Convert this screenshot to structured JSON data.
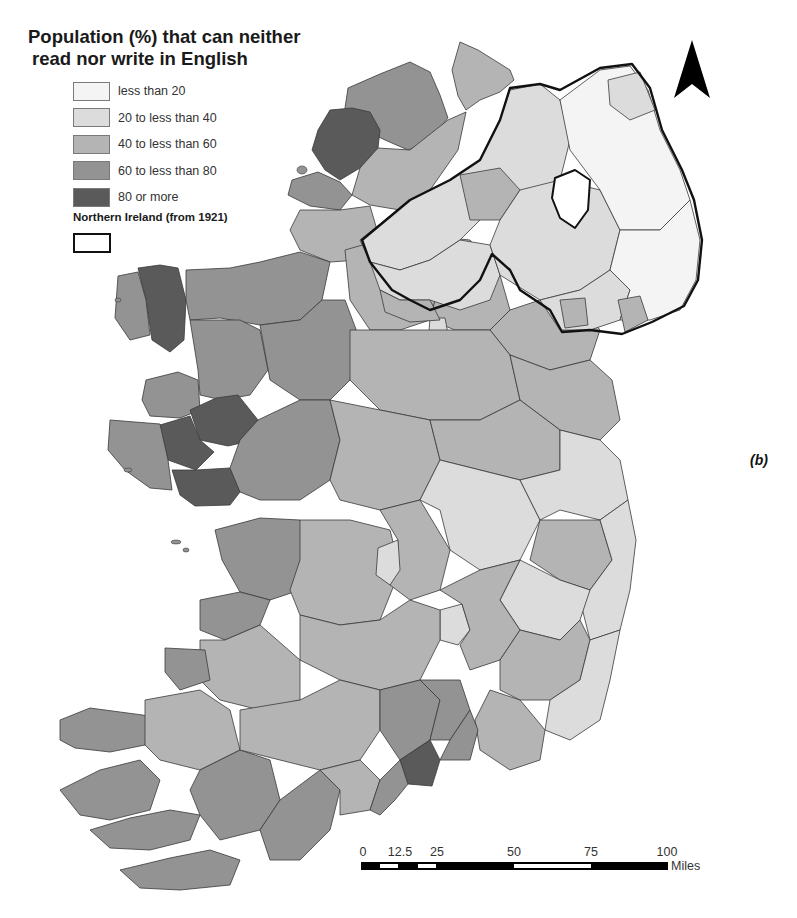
{
  "title": {
    "line1": "Population (%) that can neither",
    "line2": "read nor write in English"
  },
  "legend": {
    "items": [
      {
        "label": "less than 20",
        "color": "#f4f4f4"
      },
      {
        "label": "20 to less than 40",
        "color": "#dcdcdc"
      },
      {
        "label": "40 to less than 60",
        "color": "#b4b4b4"
      },
      {
        "label": "60 to less than 80",
        "color": "#939393"
      },
      {
        "label": "80 or more",
        "color": "#5a5a5a"
      }
    ],
    "boundary_label": "Northern Ireland (from 1921)"
  },
  "panel_label": "(b)",
  "north_arrow": "north-arrow-icon",
  "scale_bar": {
    "ticks": [
      "0",
      "12.5",
      "25",
      "50",
      "75",
      "100"
    ],
    "unit": "Miles"
  }
}
